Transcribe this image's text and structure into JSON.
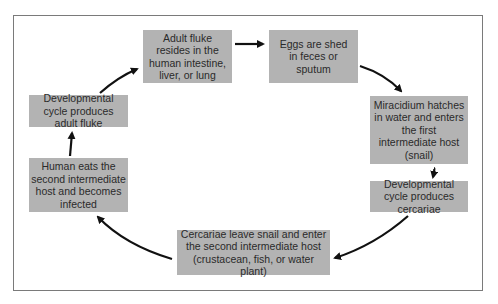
{
  "diagram": {
    "type": "cycle",
    "title": "",
    "steps": [
      {
        "id": "adult-fluke",
        "label": "Adult fluke resides in the human intestine, liver, or lung"
      },
      {
        "id": "eggs-shed",
        "label": "Eggs are shed in feces or sputum"
      },
      {
        "id": "miracidium",
        "label": "Miracidium hatches in water and enters the first intermediate host (snail)"
      },
      {
        "id": "dev-cercariae",
        "label": "Developmental cycle produces cercariae"
      },
      {
        "id": "cercariae-leave",
        "label": "Cercariae leave snail and enter the second intermediate host (crustacean, fish, or water plant)"
      },
      {
        "id": "human-eats",
        "label": "Human eats the second intermediate host and becomes infected"
      },
      {
        "id": "dev-adult",
        "label": "Developmental cycle produces adult fluke"
      }
    ],
    "edges": [
      {
        "from": "adult-fluke",
        "to": "eggs-shed"
      },
      {
        "from": "eggs-shed",
        "to": "miracidium"
      },
      {
        "from": "miracidium",
        "to": "dev-cercariae"
      },
      {
        "from": "dev-cercariae",
        "to": "cercariae-leave"
      },
      {
        "from": "cercariae-leave",
        "to": "human-eats"
      },
      {
        "from": "human-eats",
        "to": "dev-adult"
      },
      {
        "from": "dev-adult",
        "to": "adult-fluke"
      }
    ],
    "colors": {
      "box_fill": "#b3b3b3",
      "text": "#2a2a2a",
      "arrow": "#111111",
      "frame": "#7a7a7a"
    }
  }
}
